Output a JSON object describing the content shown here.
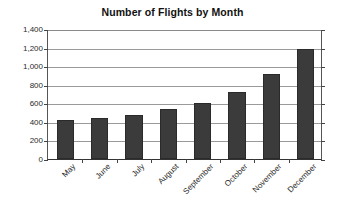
{
  "chart_data": {
    "type": "bar",
    "title": "Number of Flights by Month",
    "xlabel": "",
    "ylabel": "",
    "categories": [
      "May",
      "June",
      "July",
      "August",
      "September",
      "October",
      "November",
      "December"
    ],
    "values": [
      420,
      440,
      470,
      540,
      600,
      720,
      920,
      1180
    ],
    "ylim": [
      0,
      1400
    ],
    "ytick_values": [
      0,
      200,
      400,
      600,
      800,
      1000,
      1200,
      1400
    ],
    "ytick_labels": [
      "0",
      "200",
      "400",
      "600",
      "800",
      "1,000",
      "1,200",
      "1,400"
    ],
    "grid": true,
    "legend": false,
    "bar_color": "#3b3b3b",
    "grid_color": "#9a9a9a",
    "axis_color": "#444444",
    "background": "#ffffff"
  }
}
